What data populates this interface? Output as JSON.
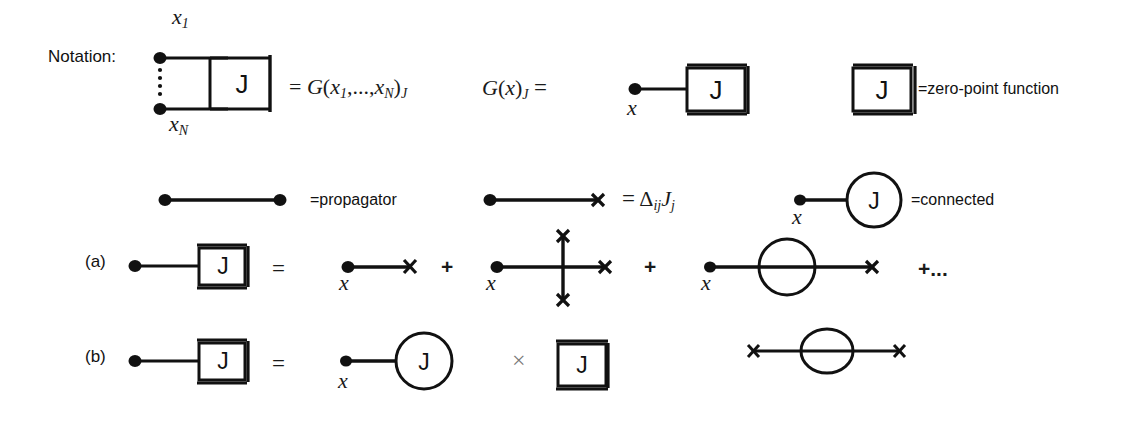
{
  "figure": {
    "title_label": "Notation:",
    "background": "#ffffff",
    "ink": "#111111",
    "muted_ink": "#777777"
  },
  "legend_row1": {
    "npoint": {
      "top_point_label": "x1",
      "bottom_point_label": "xN",
      "box_symbol": "J",
      "equals": "=",
      "result": "G(x1,...,xN)J",
      "result_fn": "G",
      "result_args": "(x1,...,xN)",
      "result_sub": "J"
    },
    "onepoint": {
      "lhs_fn": "G",
      "lhs_args": "(x)",
      "lhs_sub": "J",
      "equals": "=",
      "point_label": "x",
      "box_symbol": "J"
    },
    "zeropoint": {
      "box_symbol": "J",
      "equals_label": "=zero-point function"
    }
  },
  "legend_row2": {
    "propagator": {
      "equals_label": "=propagator"
    },
    "source": {
      "equals": "=",
      "expr": "ΔijJj",
      "delta": "Δ",
      "delta_sub": "ij",
      "source_sym": "J",
      "source_sub": "j"
    },
    "connected": {
      "point_label": "x",
      "circle_symbol": "J",
      "equals_label": "=connected"
    }
  },
  "row_a": {
    "tag": "(a)",
    "lhs": {
      "box_symbol": "J"
    },
    "equals": "=",
    "terms": [
      {
        "kind": "single-cross",
        "point_label": "x"
      },
      {
        "kind": "three-cross-vertex",
        "point_label": "x",
        "cross_count": 3
      },
      {
        "kind": "loop-cross",
        "point_label": "x"
      }
    ],
    "plus_signs": [
      "+",
      "+"
    ],
    "ellipsis": "+..."
  },
  "row_b": {
    "tag": "(b)",
    "lhs": {
      "box_symbol": "J"
    },
    "equals": "=",
    "first_factor": {
      "kind": "connected-blob",
      "point_label": "x",
      "circle_symbol": "J"
    },
    "multiply": "×",
    "second_factor": {
      "kind": "zero-point-box",
      "box_symbol": "J"
    },
    "extra_term": {
      "kind": "cross-loop-cross"
    }
  }
}
